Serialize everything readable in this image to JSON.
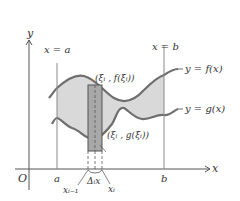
{
  "diagram": {
    "type": "area-between-curves",
    "axes": {
      "x_label": "x",
      "y_label": "y",
      "origin_label": "O"
    },
    "vertical_lines": {
      "left_label": "x = a",
      "right_label": "x = b"
    },
    "x_ticks": {
      "a": "a",
      "b": "b"
    },
    "curves": {
      "upper_label": "y = f(x)",
      "lower_label": "y = g(x)"
    },
    "rectangle": {
      "top_point_label": "(ξᵢ , f(ξᵢ))",
      "bottom_point_label": "(ξᵢ , g(ξᵢ))",
      "width_label": "Δᵢx",
      "left_end_label": "xᵢ₋₁",
      "right_end_label": "xᵢ"
    },
    "colors": {
      "fill": "#d9d9d9",
      "curve": "#6e6e6e",
      "rect": "#a8a8a8",
      "axis": "#555555"
    }
  }
}
